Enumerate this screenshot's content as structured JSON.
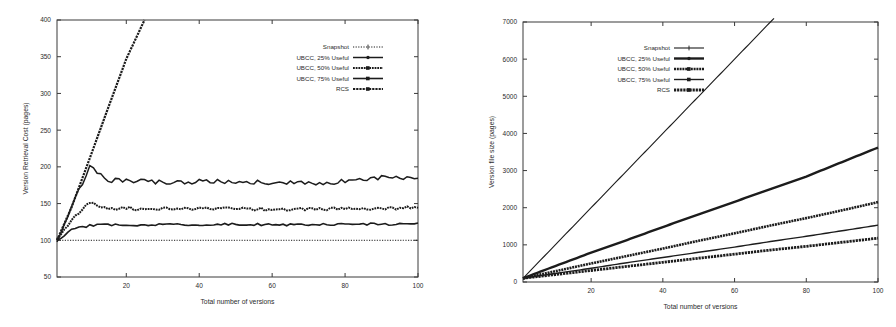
{
  "figure": {
    "background_color": "#ffffff",
    "ink_color": "#1c1c1c",
    "panels": [
      "left",
      "right"
    ]
  },
  "legend_series_names": [
    "Snapshot",
    "UBCC, 25% Useful",
    "UBCC, 50% Useful",
    "UBCC, 75% Useful",
    "RCS"
  ],
  "left_panel": {
    "name": "version-retrieval-cost-chart",
    "xlabel": "Total number of versions",
    "ylabel": "Version Retrieval Cost (pages)",
    "xticks": [
      "20",
      "40",
      "60",
      "80",
      "100"
    ],
    "yticks": [
      "50",
      "100",
      "150",
      "200",
      "250",
      "300",
      "350",
      "400"
    ]
  },
  "right_panel": {
    "name": "version-file-size-chart",
    "xlabel": "Total number of versions",
    "ylabel": "Version file size (pages)",
    "xticks": [
      "20",
      "40",
      "60",
      "80",
      "100"
    ],
    "yticks": [
      "0",
      "1000",
      "2000",
      "3000",
      "4000",
      "5000",
      "6000",
      "7000"
    ]
  },
  "chart_data": [
    {
      "type": "line",
      "id": "version-retrieval-cost",
      "title": "",
      "xlabel": "Total number of versions",
      "ylabel": "Version Retrieval Cost (pages)",
      "xlim": [
        1,
        100
      ],
      "ylim": [
        50,
        400
      ],
      "xticks": [
        20,
        40,
        60,
        80,
        100
      ],
      "yticks": [
        50,
        100,
        150,
        200,
        250,
        300,
        350,
        400
      ],
      "grid": false,
      "legend_position": "upper-right",
      "x": [
        1,
        5,
        10,
        15,
        20,
        25,
        30,
        40,
        50,
        60,
        70,
        80,
        90,
        100
      ],
      "series": [
        {
          "name": "Snapshot",
          "marker": "plus",
          "values": [
            100,
            100,
            100,
            100,
            100,
            100,
            100,
            100,
            100,
            100,
            100,
            100,
            100,
            100
          ],
          "note": "constant 100 pages, independent of number of versions"
        },
        {
          "name": "UBCC, 75% Useful",
          "marker": "square",
          "values": [
            100,
            115,
            120,
            121,
            121,
            121,
            122,
            121,
            122,
            121,
            121,
            122,
            122,
            122
          ],
          "plateau": 121,
          "note": "rises quickly then stays flat near 121 with small oscillation"
        },
        {
          "name": "UBCC, 50% Useful",
          "marker": "square",
          "values": [
            100,
            128,
            152,
            143,
            144,
            142,
            143,
            143,
            143,
            142,
            143,
            143,
            144,
            144
          ],
          "plateau": 143,
          "note": "small overshoot near x=8 (~152) then flat near 143"
        },
        {
          "name": "UBCC, 25% Useful",
          "marker": "dot",
          "values": [
            100,
            145,
            200,
            182,
            181,
            180,
            179,
            180,
            180,
            179,
            178,
            180,
            186,
            184
          ],
          "plateau": 180,
          "note": "overshoot to ~200 near x=11 then flat near 180"
        },
        {
          "name": "RCS",
          "marker": "filled-square",
          "values": [
            100,
            145,
            212,
            280,
            347,
            400,
            null,
            null,
            null,
            null,
            null,
            null,
            null,
            null
          ],
          "slope_pages_per_version": 11.5,
          "note": "linear growth, leaves the top of the plot (400) near x=27"
        }
      ]
    },
    {
      "type": "line",
      "id": "version-file-size",
      "title": "",
      "xlabel": "Total number of versions",
      "ylabel": "Version file size (pages)",
      "xlim": [
        1,
        100
      ],
      "ylim": [
        0,
        7000
      ],
      "xticks": [
        20,
        40,
        60,
        80,
        100
      ],
      "yticks": [
        0,
        1000,
        2000,
        3000,
        4000,
        5000,
        6000,
        7000
      ],
      "grid": false,
      "legend_position": "upper-left-center",
      "x": [
        1,
        10,
        20,
        30,
        40,
        50,
        60,
        70,
        80,
        90,
        100
      ],
      "series": [
        {
          "name": "Snapshot",
          "marker": "plus",
          "values": [
            100,
            1000,
            2000,
            3000,
            4000,
            5000,
            6000,
            7000,
            null,
            null,
            null
          ],
          "slope_pages_per_version": 100,
          "note": "linear, exits top of plot (7000) near x=70"
        },
        {
          "name": "UBCC, 25% Useful",
          "marker": "dot",
          "values": [
            100,
            430,
            790,
            1130,
            1480,
            1820,
            2160,
            2500,
            2840,
            3230,
            3620
          ],
          "endpoint": 3620
        },
        {
          "name": "UBCC, 50% Useful",
          "marker": "square",
          "values": [
            100,
            290,
            500,
            700,
            900,
            1110,
            1310,
            1520,
            1720,
            1930,
            2150
          ],
          "endpoint": 2150
        },
        {
          "name": "UBCC, 75% Useful",
          "marker": "square",
          "values": [
            100,
            230,
            370,
            520,
            660,
            800,
            940,
            1090,
            1230,
            1380,
            1530
          ],
          "endpoint": 1530
        },
        {
          "name": "RCS",
          "marker": "filled-square",
          "values": [
            100,
            200,
            310,
            420,
            530,
            640,
            750,
            860,
            960,
            1070,
            1180
          ],
          "endpoint": 1180
        }
      ]
    }
  ]
}
